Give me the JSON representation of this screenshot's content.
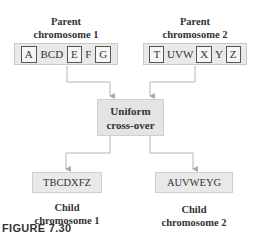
{
  "parents": [
    {
      "title_line1": "Parent",
      "title_line2": "chromosome 1",
      "genes": [
        {
          "text": "A",
          "boxed": true
        },
        {
          "text": "BCD",
          "boxed": false
        },
        {
          "text": "E",
          "boxed": true
        },
        {
          "text": "F",
          "boxed": false
        },
        {
          "text": "G",
          "boxed": true
        }
      ]
    },
    {
      "title_line1": "Parent",
      "title_line2": "chromosome 2",
      "genes": [
        {
          "text": "T",
          "boxed": true
        },
        {
          "text": "UVW",
          "boxed": false
        },
        {
          "text": "X",
          "boxed": true
        },
        {
          "text": "Y",
          "boxed": false
        },
        {
          "text": "Z",
          "boxed": true
        }
      ]
    }
  ],
  "operator": {
    "line1": "Uniform",
    "line2": "cross-over"
  },
  "children": [
    {
      "sequence": "TBCDXFZ",
      "title_line1": "Child",
      "title_line2": "chromosome 1"
    },
    {
      "sequence": "AUVWEYG",
      "title_line1": "Child",
      "title_line2": "chromosome 2"
    }
  ],
  "caption": "FIGURE 7.30",
  "colors": {
    "box_fill": "#e9e9e9",
    "box_border": "#c9c9c9",
    "connector": "#b0b0b0",
    "gene_border": "#555555"
  }
}
